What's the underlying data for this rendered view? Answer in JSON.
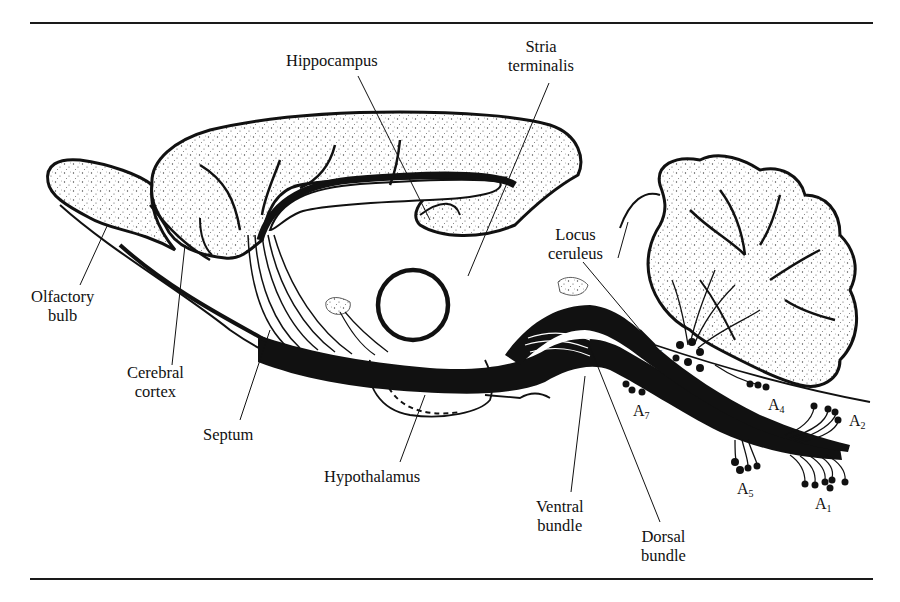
{
  "figure": {
    "labels": {
      "hippocampus": "Hippocampus",
      "stria_terminalis": [
        "Stria",
        "terminalis"
      ],
      "olfactory_bulb": [
        "Olfactory",
        "bulb"
      ],
      "cerebral_cortex": [
        "Cerebral",
        "cortex"
      ],
      "septum": "Septum",
      "hypothalamus": "Hypothalamus",
      "locus_ceruleus": [
        "Locus",
        "ceruleus"
      ],
      "ventral_bundle": [
        "Ventral",
        "bundle"
      ],
      "dorsal_bundle": [
        "Dorsal",
        "bundle"
      ]
    },
    "cell_groups": [
      {
        "letter": "A",
        "sub": "6"
      },
      {
        "letter": "A",
        "sub": "7"
      },
      {
        "letter": "A",
        "sub": "4"
      },
      {
        "letter": "A",
        "sub": "2"
      },
      {
        "letter": "A",
        "sub": "5"
      },
      {
        "letter": "A",
        "sub": "1"
      }
    ],
    "colors": {
      "ink": "#111111",
      "background": "#ffffff",
      "stipple": "#555555"
    }
  }
}
